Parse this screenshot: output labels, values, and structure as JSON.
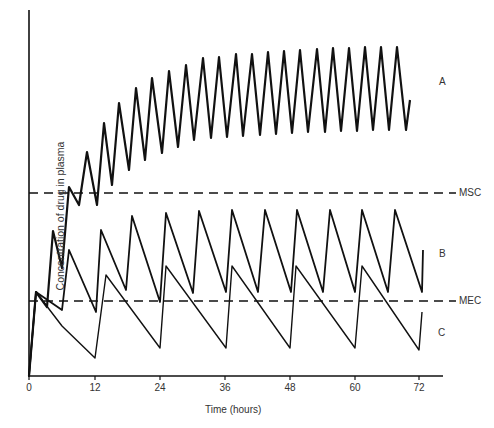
{
  "chart_data": {
    "type": "line",
    "title": "",
    "xlabel": "Time (hours)",
    "ylabel": "Concentration of drug in plasma",
    "x_ticks": [
      0,
      12,
      24,
      36,
      48,
      60,
      72
    ],
    "xlim": [
      0,
      76
    ],
    "ylim": [
      0,
      1
    ],
    "grid": false,
    "y_tick_labels": false,
    "reference_lines": [
      {
        "name": "MSC",
        "label": "MSC",
        "style": "dashed",
        "y_relative": 0.5
      },
      {
        "name": "MEC",
        "label": "MEC",
        "style": "dashed",
        "y_relative": 0.2
      }
    ],
    "series": [
      {
        "name": "A",
        "label": "A",
        "dosing_interval_h": 3,
        "description": "Dosing every 3 h; accumulates above MSC, plateau oscillating between ~0.67 and ~0.90",
        "points_px": [
          [
            29,
            376
          ],
          [
            36,
            292
          ],
          [
            47,
            307
          ],
          [
            53,
            231
          ],
          [
            62,
            268
          ],
          [
            69,
            187
          ],
          [
            79,
            205
          ],
          [
            87,
            152
          ],
          [
            97,
            205
          ],
          [
            104,
            123
          ],
          [
            112,
            185
          ],
          [
            119,
            103
          ],
          [
            129,
            170
          ],
          [
            136,
            88
          ],
          [
            145,
            160
          ],
          [
            152,
            78
          ],
          [
            162,
            153
          ],
          [
            169,
            71
          ],
          [
            178,
            147
          ],
          [
            186,
            65
          ],
          [
            194,
            140
          ],
          [
            203,
            58
          ],
          [
            211,
            138
          ],
          [
            219,
            57
          ],
          [
            227,
            137
          ],
          [
            236,
            54
          ],
          [
            243,
            136
          ],
          [
            252,
            54
          ],
          [
            260,
            135
          ],
          [
            268,
            52
          ],
          [
            276,
            134
          ],
          [
            284,
            51
          ],
          [
            292,
            133
          ],
          [
            300,
            50
          ],
          [
            308,
            132
          ],
          [
            317,
            49
          ],
          [
            325,
            132
          ],
          [
            333,
            48
          ],
          [
            341,
            131
          ],
          [
            349,
            48
          ],
          [
            357,
            131
          ],
          [
            365,
            47
          ],
          [
            373,
            130
          ],
          [
            381,
            47
          ],
          [
            389,
            130
          ],
          [
            397,
            47
          ],
          [
            406,
            130
          ],
          [
            410,
            100
          ]
        ]
      },
      {
        "name": "B",
        "label": "B",
        "dosing_interval_h": 6,
        "description": "Dosing every 6 h; oscillates between MEC and MSC",
        "points_px": [
          [
            29,
            376
          ],
          [
            36,
            292
          ],
          [
            62,
            310
          ],
          [
            69,
            250
          ],
          [
            96,
            312
          ],
          [
            101,
            230
          ],
          [
            126,
            290
          ],
          [
            132,
            216
          ],
          [
            160,
            302
          ],
          [
            166,
            213
          ],
          [
            193,
            293
          ],
          [
            199,
            211
          ],
          [
            226,
            292
          ],
          [
            232,
            210
          ],
          [
            258,
            292
          ],
          [
            265,
            210
          ],
          [
            291,
            292
          ],
          [
            297,
            210
          ],
          [
            323,
            292
          ],
          [
            330,
            210
          ],
          [
            355,
            292
          ],
          [
            362,
            210
          ],
          [
            388,
            292
          ],
          [
            395,
            210
          ],
          [
            422,
            292
          ],
          [
            423,
            250
          ]
        ]
      },
      {
        "name": "C",
        "label": "C",
        "dosing_interval_h": 12,
        "description": "Dosing every 12 h; falls below MEC for part of each interval",
        "points_px": [
          [
            29,
            376
          ],
          [
            36,
            292
          ],
          [
            62,
            326
          ],
          [
            95,
            358
          ],
          [
            106,
            275
          ],
          [
            160,
            348
          ],
          [
            166,
            266
          ],
          [
            226,
            348
          ],
          [
            232,
            266
          ],
          [
            290,
            348
          ],
          [
            296,
            266
          ],
          [
            355,
            348
          ],
          [
            362,
            266
          ],
          [
            419,
            350
          ],
          [
            422,
            312
          ]
        ]
      }
    ]
  },
  "labels": {
    "series_a": "A",
    "series_b": "B",
    "series_c": "C",
    "msc": "MSC",
    "mec": "MEC",
    "x_title": "Time (hours)",
    "y_title": "Concentration of drug in plasma",
    "ticks": [
      "0",
      "12",
      "24",
      "36",
      "48",
      "60",
      "72"
    ]
  },
  "style": {
    "line_color": "#111111",
    "axis_color": "#111111"
  }
}
